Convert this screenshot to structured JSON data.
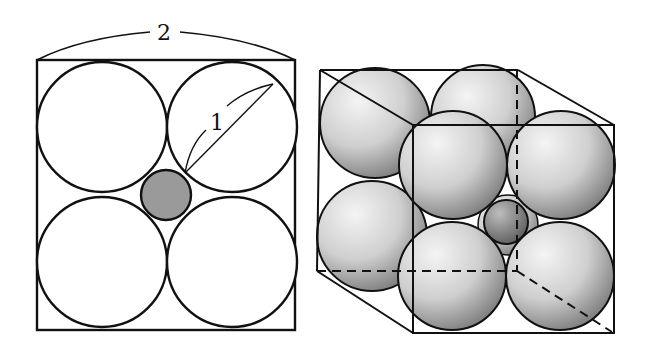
{
  "figure": {
    "left_panel": {
      "title": "2D cross-section of face of cubic cell",
      "edge_label": "2",
      "diagonal_label": "1",
      "large_circle_fill": "#ffffff",
      "small_circle_fill": "#9a9a9a"
    },
    "right_panel": {
      "title": "3D cubic cell with packed spheres",
      "sphere_fill_light": "#f2f2f2",
      "sphere_fill_dark": "#8a8a8a",
      "small_sphere_fill_dark": "#6e6e6e"
    },
    "line_color": "#111111"
  }
}
